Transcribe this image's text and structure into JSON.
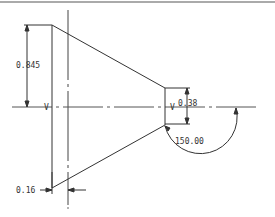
{
  "drawing": {
    "line_color": "#333333",
    "border_color": "#999999",
    "dimensions": {
      "height_large": "0.845",
      "height_small": "0.38",
      "offset": "0.16",
      "angle": "150.00"
    },
    "datum_marks": {
      "left": "V",
      "right": "V"
    }
  }
}
